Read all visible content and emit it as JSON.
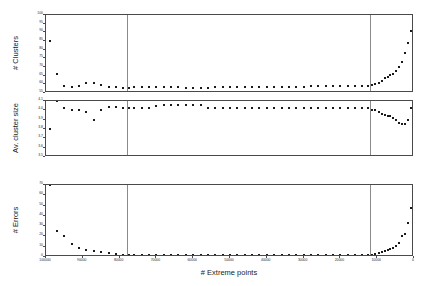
{
  "chart_data": {
    "type": "scatter",
    "title": "",
    "xlabel": "# Extreme points",
    "x_axis_reversed": true,
    "xlim": [
      0,
      100000
    ],
    "xticks": [
      100000,
      90000,
      80000,
      70000,
      60000,
      50000,
      40000,
      30000,
      20000,
      10000,
      0
    ],
    "xticklabels": [
      "100000",
      "90000",
      "80000",
      "70000",
      "60000",
      "50000",
      "40000",
      "30000",
      "20000",
      "10000",
      "0"
    ],
    "grid": false,
    "legend": null,
    "panels": [
      {
        "id": "clusters",
        "ylabel": "# Clusters",
        "ylim": [
          55,
          100
        ],
        "yticks": [
          55,
          60,
          65,
          70,
          75,
          80,
          85,
          90,
          95,
          100
        ],
        "yticklabels": [
          "55",
          "60",
          "65",
          "70",
          "75",
          "80",
          "85",
          "90",
          "95",
          "100"
        ],
        "vline_x": 78000,
        "vline_x2": 12000,
        "x": [
          99000,
          97000,
          95000,
          93000,
          91000,
          89000,
          87000,
          85000,
          83000,
          81000,
          79000,
          77500,
          76000,
          74000,
          72000,
          70000,
          68000,
          66000,
          64000,
          62000,
          60000,
          58000,
          56000,
          54000,
          52000,
          50000,
          48000,
          46000,
          44000,
          42000,
          40000,
          38000,
          36000,
          34000,
          32000,
          30000,
          28000,
          26000,
          24000,
          22000,
          20000,
          18000,
          16000,
          14000,
          12500,
          11500,
          10500,
          9500,
          8800,
          8000,
          7200,
          6400,
          5600,
          4800,
          4000,
          3200,
          2400,
          1600,
          900,
          300
        ],
        "y": [
          85,
          66,
          59,
          58.5,
          59,
          60.5,
          60.5,
          59.5,
          58.5,
          58.5,
          58,
          58,
          58.5,
          58.5,
          58.5,
          58.5,
          58.5,
          58.3,
          58.3,
          58,
          58,
          58,
          58,
          58.3,
          58.3,
          58.3,
          58.3,
          58.3,
          58.5,
          58.5,
          58.5,
          58.5,
          58.5,
          58.5,
          58.5,
          58.5,
          58.8,
          58.8,
          58.8,
          58.8,
          58.8,
          59,
          59,
          59,
          59.2,
          59.5,
          60,
          61,
          62,
          63.5,
          64.5,
          65.5,
          66,
          67.5,
          70,
          73,
          78,
          84,
          91,
          96
        ]
      },
      {
        "id": "avg_cluster_size",
        "ylabel": "Av. cluster size",
        "ylim": [
          3.5,
          4.1
        ],
        "yticks": [
          3.5,
          3.6,
          3.7,
          3.8,
          3.9,
          4.0,
          4.1
        ],
        "yticklabels": [
          "3.5",
          "3.6",
          "3.7",
          "3.8",
          "3.9",
          "4.0",
          "4.1"
        ],
        "vline_x": 78000,
        "vline_x2": 12000,
        "x": [
          99000,
          97000,
          95000,
          93000,
          91000,
          89000,
          87000,
          85000,
          83000,
          81000,
          79000,
          77500,
          76000,
          74000,
          72000,
          70000,
          68000,
          66000,
          64000,
          62000,
          60000,
          58000,
          56000,
          54000,
          52000,
          50000,
          48000,
          46000,
          44000,
          42000,
          40000,
          38000,
          36000,
          34000,
          32000,
          30000,
          28000,
          26000,
          24000,
          22000,
          20000,
          18000,
          16000,
          14000,
          12500,
          11500,
          10500,
          9500,
          8800,
          8000,
          7200,
          6400,
          5600,
          4800,
          4000,
          3200,
          2400,
          1600,
          900,
          300
        ],
        "y": [
          3.8,
          4.1,
          4.02,
          4.0,
          4.0,
          3.98,
          3.9,
          4.0,
          4.04,
          4.04,
          4.03,
          4.03,
          4.02,
          4.02,
          4.02,
          4.05,
          4.06,
          4.06,
          4.06,
          4.06,
          4.06,
          4.06,
          4.03,
          4.02,
          4.02,
          4.02,
          4.02,
          4.02,
          4.02,
          4.02,
          4.02,
          4.02,
          4.02,
          4.02,
          4.02,
          4.02,
          4.02,
          4.02,
          4.02,
          4.02,
          4.02,
          4.02,
          4.02,
          4.02,
          4.02,
          4.0,
          4.0,
          3.98,
          3.96,
          3.95,
          3.94,
          3.94,
          3.92,
          3.9,
          3.86,
          3.85,
          3.85,
          3.9,
          4.02,
          4.03
        ]
      },
      {
        "id": "errors",
        "ylabel": "# Errors",
        "ylim": [
          0,
          70
        ],
        "yticks": [
          0,
          10,
          20,
          30,
          40,
          50,
          60,
          70
        ],
        "yticklabels": [
          "0",
          "10",
          "20",
          "30",
          "40",
          "50",
          "60",
          "70"
        ],
        "vline_x": 78000,
        "vline_x2": 12000,
        "x": [
          99000,
          97000,
          95000,
          93000,
          91000,
          89000,
          87000,
          85000,
          83000,
          81000,
          79000,
          77500,
          76000,
          74000,
          72000,
          70000,
          68000,
          66000,
          64000,
          62000,
          60000,
          58000,
          56000,
          54000,
          52000,
          50000,
          48000,
          46000,
          44000,
          42000,
          40000,
          38000,
          36000,
          34000,
          32000,
          30000,
          28000,
          26000,
          24000,
          22000,
          20000,
          18000,
          16000,
          14000,
          12500,
          11500,
          10500,
          9500,
          8800,
          8000,
          7200,
          6400,
          5600,
          4800,
          4000,
          3200,
          2400,
          1600,
          900,
          300
        ],
        "y": [
          70,
          25,
          20,
          13,
          9,
          7,
          6,
          5,
          4,
          3,
          2,
          2,
          2,
          2,
          2,
          2,
          2,
          2,
          2,
          2,
          2,
          2,
          2,
          2,
          2,
          2,
          2,
          2,
          2,
          2,
          2,
          2,
          2,
          2,
          2,
          2,
          2,
          2,
          2,
          2,
          2,
          2,
          2,
          2,
          2,
          2,
          3,
          4,
          5,
          6,
          7,
          8,
          9,
          11,
          14,
          20,
          22,
          33,
          48,
          58
        ]
      }
    ]
  }
}
